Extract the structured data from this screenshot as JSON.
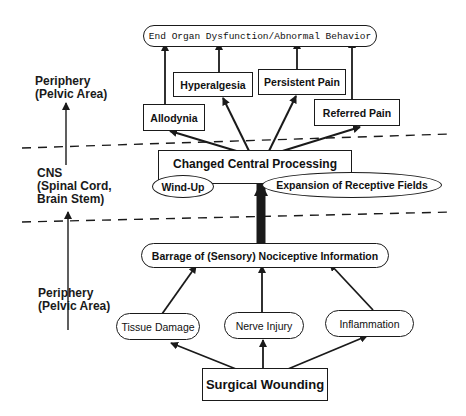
{
  "diagram": {
    "levels": {
      "top": {
        "line1": "Periphery",
        "line2": "(Pelvic Area)"
      },
      "middle": {
        "line1": "CNS",
        "line2": "(Spinal Cord,",
        "line3": "Brain Stem)"
      },
      "bottom": {
        "line1": "Periphery",
        "line2": "(Pelvic Area)"
      }
    },
    "nodes": {
      "end_organ": "End Organ Dysfunction/Abnormal Behavior",
      "hyperalgesia": "Hyperalgesia",
      "persistent_pain": "Persistent Pain",
      "allodynia": "Allodynia",
      "referred_pain": "Referred Pain",
      "changed_central": "Changed Central Processing",
      "wind_up": "Wind-Up",
      "expansion": "Expansion of Receptive Fields",
      "barrage": "Barrage of (Sensory) Nociceptive Information",
      "tissue_damage": "Tissue Damage",
      "nerve_injury": "Nerve Injury",
      "inflammation": "Inflammation",
      "surgical_wounding": "Surgical Wounding"
    },
    "colors": {
      "ink": "#1a1a1a",
      "background": "#ffffff"
    }
  }
}
